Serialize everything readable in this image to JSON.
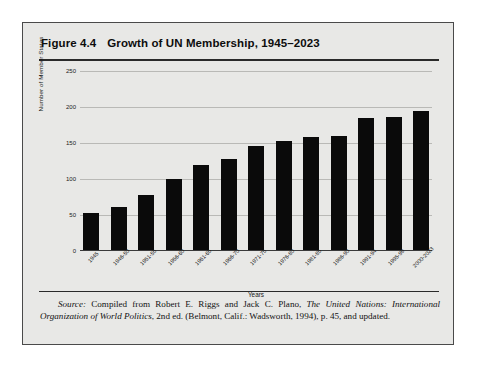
{
  "figure": {
    "number_label": "Figure 4.4",
    "title": "Growth of UN Membership, 1945–2023"
  },
  "source_note": {
    "label": "Source:",
    "text_1": " Compiled from Robert E. Riggs and Jack C. Plano, ",
    "italic_1": "The United Nations: International Organization of World Politics",
    "text_2": ", 2nd ed. (Belmont, Calif.: Wadsworth, 1994), p. 45, and updated."
  },
  "chart_data": {
    "type": "bar",
    "title": "Growth of UN Membership, 1945–2023",
    "xlabel": "Years",
    "ylabel": "Number of Member States",
    "ylim": [
      0,
      250
    ],
    "yticks": [
      0,
      50,
      100,
      150,
      200,
      250
    ],
    "ytick_labels": [
      "0",
      "50",
      "100",
      "150",
      "200",
      "250"
    ],
    "grid": true,
    "legend": "none",
    "bar_color": "#0a0a0a",
    "categories": [
      "1945",
      "1946-50",
      "1951-55",
      "1956-60",
      "1961-65",
      "1966-70",
      "1971-75",
      "1976-80",
      "1981-85",
      "1986-90",
      "1991-94",
      "1995-99",
      "2000-2023"
    ],
    "values": [
      51,
      60,
      76,
      99,
      118,
      127,
      144,
      152,
      157,
      159,
      184,
      185,
      193
    ]
  }
}
